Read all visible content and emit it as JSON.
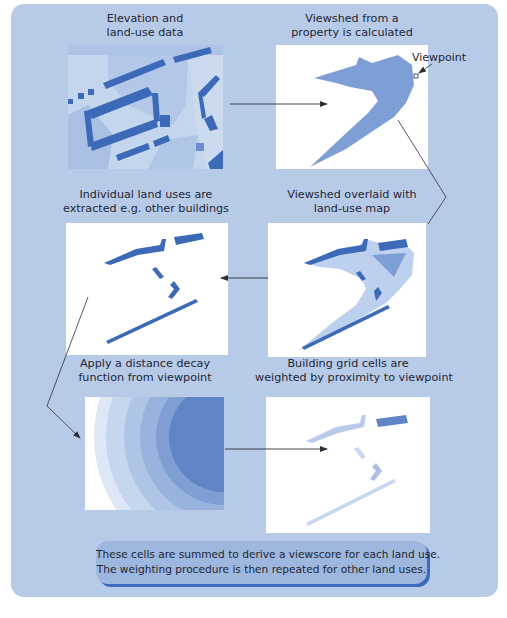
{
  "diagram": {
    "background_color": "#b7cbe9",
    "steps": [
      {
        "id": "elevation-landuse",
        "caption_lines": [
          "Elevation and",
          "land-use data"
        ]
      },
      {
        "id": "viewshed",
        "caption_lines": [
          "Viewshed from a",
          "property is calculated"
        ],
        "annotation": "Viewpoint"
      },
      {
        "id": "extract-landuses",
        "caption_lines": [
          "Individual land uses are",
          "extracted e.g. other buildings"
        ]
      },
      {
        "id": "viewshed-overlay",
        "caption_lines": [
          "Viewshed overlaid with",
          "land-use map"
        ]
      },
      {
        "id": "distance-decay",
        "caption_lines": [
          "Apply a distance decay",
          "function from viewpoint"
        ]
      },
      {
        "id": "weighted-cells",
        "caption_lines": [
          "Building grid cells are",
          "weighted by proximity to viewpoint"
        ]
      }
    ],
    "flow": [
      [
        "elevation-landuse",
        "viewshed"
      ],
      [
        "viewshed",
        "viewshed-overlay"
      ],
      [
        "viewshed-overlay",
        "extract-landuses"
      ],
      [
        "extract-landuses",
        "distance-decay"
      ],
      [
        "distance-decay",
        "weighted-cells"
      ]
    ],
    "summary_lines": [
      "These cells are summed to derive a viewscore for each land use.",
      "The weighting procedure is then repeated for other land uses."
    ],
    "colors": {
      "building": "#3d6ab8",
      "viewshed": "#7e9fd6",
      "viewshed_overlay": "#bdd0ee",
      "landuse_light": "#c4d5ee",
      "landuse_mid": "#a9c0e4",
      "decay_rings": [
        "#ffffff",
        "#dde7f5",
        "#c5d6ee",
        "#aec5e6",
        "#98b3dd",
        "#7f9ed3",
        "#5f85c7"
      ],
      "summary_fill": "#9db7de",
      "summary_shadow": "#3c6ac0",
      "arrow": "#2a2f3a"
    }
  }
}
